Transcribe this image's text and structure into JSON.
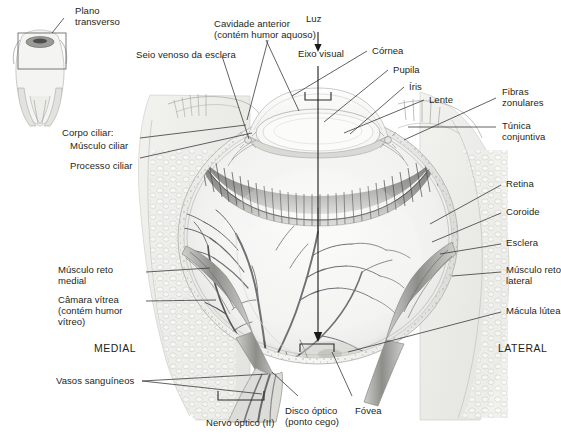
{
  "figure": {
    "background_color": "#ffffff",
    "label_color": "#231f20",
    "leader_color": "#3a3a3a"
  },
  "inset": {
    "label": "Plano\ntransverso",
    "description": "eyeball-superior-view-with-plane-box"
  },
  "orientation": {
    "medial": "MEDIAL",
    "lateral": "LATERAL"
  },
  "light": {
    "label": "Luz",
    "axis_label": "Eixo visual"
  },
  "labels": {
    "seio_venoso": "Seio venoso da esclera",
    "cavidade_anterior": "Cavidade anterior\n(contém humor aquoso)",
    "cornea": "Córnea",
    "pupila": "Pupila",
    "iris": "Íris",
    "lente": "Lente",
    "fibras_zonulares": "Fibras\nzonulares",
    "tunica_conjuntiva": "Túnica\nconjuntiva",
    "corpo_ciliar": "Corpo ciliar:",
    "musculo_ciliar": "Músculo ciliar",
    "processo_ciliar": "Processo ciliar",
    "retina": "Retina",
    "coroide": "Coroide",
    "esclera": "Esclera",
    "musculo_reto_lateral": "Músculo reto\nlateral",
    "macula_lutea": "Mácula lútea",
    "musculo_reto_medial": "Músculo reto\nmedial",
    "camara_vitrea": "Câmara vítrea\n(contém humor\nvítreo)",
    "vasos_sanguineos": "Vasos sanguíneos",
    "nervo_optico": "Nervo óptico (II)",
    "disco_optico": "Disco óptico\n(ponto cego)",
    "fovea": "Fóvea"
  }
}
